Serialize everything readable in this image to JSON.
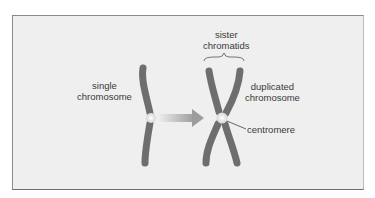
{
  "diagram": {
    "labels": {
      "single_chromosome": [
        "single",
        "chromosome"
      ],
      "sister_chromatids": [
        "sister",
        "chromatids"
      ],
      "duplicated_chromosome": [
        "duplicated",
        "chromosome"
      ],
      "centromere": "centromere"
    },
    "colors": {
      "background": "#efefef",
      "chromosome": "#7a7a7a",
      "chromosome_dark": "#5e5e5e",
      "centromere": "#f4f4f4",
      "arrow": "#a8a8a8",
      "text": "#3a3a3a"
    }
  }
}
